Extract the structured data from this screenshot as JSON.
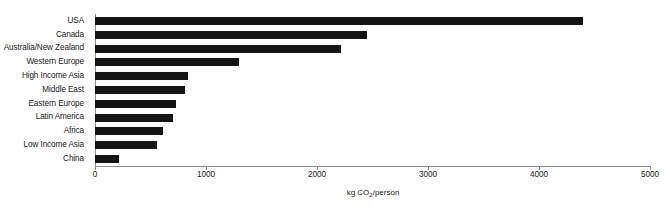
{
  "chart_data": {
    "type": "bar",
    "orientation": "horizontal",
    "title": "",
    "xlabel": "kg CO2/person",
    "xlabel_parts": {
      "prefix": "kg CO",
      "sub": "2",
      "suffix": "/person"
    },
    "ylabel": "",
    "xlim": [
      0,
      5000
    ],
    "xticks": [
      0,
      1000,
      2000,
      3000,
      4000,
      5000
    ],
    "xtick_labels": [
      "0",
      "1000",
      "2000",
      "3000",
      "4000",
      "5000"
    ],
    "grid": false,
    "legend": null,
    "bar_color": "#151515",
    "axis_color": "#8c8c8c",
    "categories": [
      "USA",
      "Canada",
      "Australia/New Zealand",
      "Western Europe",
      "High Income Asia",
      "Middle East",
      "Eastern Europe",
      "Latin America",
      "Africa",
      "Low Income Asia",
      "China"
    ],
    "values": [
      4400,
      2450,
      2220,
      1300,
      840,
      810,
      730,
      700,
      610,
      560,
      220
    ]
  }
}
